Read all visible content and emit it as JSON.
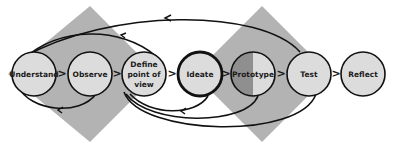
{
  "diagram": {
    "colors": {
      "diamond": "#b3b3b3",
      "node_fill": "#dcdcdc",
      "node_dark_half": "#8f8f8f",
      "stroke": "#111111",
      "background": "#ffffff"
    },
    "stages": [
      {
        "id": "understand",
        "label": "Understand"
      },
      {
        "id": "observe",
        "label": "Observe"
      },
      {
        "id": "define",
        "label_lines": [
          "Define",
          "point of",
          "view"
        ]
      },
      {
        "id": "ideate",
        "label": "Ideate"
      },
      {
        "id": "prototype",
        "label": "Prototype"
      },
      {
        "id": "test",
        "label": "Test"
      },
      {
        "id": "reflect",
        "label": "Reflect"
      }
    ],
    "connector_glyph": ">",
    "phases": [
      {
        "id": "problem-space",
        "shape": "diamond"
      },
      {
        "id": "solution-space",
        "shape": "diamond"
      }
    ]
  }
}
